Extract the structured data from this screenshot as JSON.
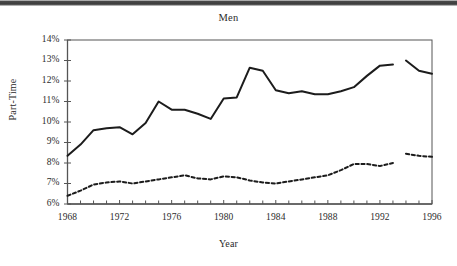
{
  "figure": {
    "title": "Men",
    "xlabel": "Year",
    "ylabel": "Part-Time"
  },
  "colors": {
    "line": "#1c1c1c",
    "axis": "#555555",
    "text": "#2b2b2b",
    "background": "#ffffff"
  },
  "axes": {
    "y_ticks": [
      "6%",
      "7%",
      "8%",
      "9%",
      "10%",
      "11%",
      "12%",
      "13%",
      "14%"
    ],
    "x_ticks": [
      "1968",
      "1972",
      "1976",
      "1980",
      "1984",
      "1988",
      "1992",
      "1996"
    ]
  },
  "chart_data": {
    "type": "line",
    "title": "Men",
    "xlabel": "Year",
    "ylabel": "Part-Time",
    "xlim": [
      1968,
      1996
    ],
    "ylim": [
      6,
      14
    ],
    "ytick_values": [
      6,
      7,
      8,
      9,
      10,
      11,
      12,
      13,
      14
    ],
    "ytick_labels": [
      "6%",
      "7%",
      "8%",
      "9%",
      "10%",
      "11%",
      "12%",
      "13%",
      "14%"
    ],
    "xtick_values": [
      1968,
      1972,
      1976,
      1980,
      1984,
      1988,
      1992,
      1996
    ],
    "xtick_labels": [
      "1968",
      "1972",
      "1976",
      "1980",
      "1984",
      "1988",
      "1992",
      "1996"
    ],
    "minor_xticks_every": 1,
    "grid": false,
    "legend": "none",
    "units": "percent",
    "note": "Both series have a data break between 1993 and 1994.",
    "series": [
      {
        "name": "Total part-time",
        "style": "solid",
        "segments": [
          {
            "x": [
              1968,
              1969,
              1970,
              1971,
              1972,
              1973,
              1974,
              1975,
              1976,
              1977,
              1978,
              1979,
              1980,
              1981,
              1982,
              1983,
              1984,
              1985,
              1986,
              1987,
              1988,
              1989,
              1990,
              1991,
              1992,
              1993
            ],
            "y": [
              8.35,
              8.9,
              9.6,
              9.7,
              9.75,
              9.4,
              9.95,
              11.0,
              10.6,
              10.6,
              10.4,
              10.15,
              11.15,
              11.2,
              12.65,
              12.5,
              11.55,
              11.4,
              11.5,
              11.35,
              11.35,
              11.5,
              11.7,
              12.25,
              12.75,
              12.8
            ]
          },
          {
            "x": [
              1994,
              1995,
              1996
            ],
            "y": [
              13.0,
              12.5,
              12.35
            ]
          }
        ]
      },
      {
        "name": "Part-time for economic reasons",
        "style": "dashed",
        "segments": [
          {
            "x": [
              1968,
              1969,
              1970,
              1971,
              1972,
              1973,
              1974,
              1975,
              1976,
              1977,
              1978,
              1979,
              1980,
              1981,
              1982,
              1983,
              1984,
              1985,
              1986,
              1987,
              1988,
              1989,
              1990,
              1991,
              1992,
              1993
            ],
            "y": [
              6.4,
              6.65,
              6.95,
              7.05,
              7.1,
              7.0,
              7.1,
              7.2,
              7.3,
              7.4,
              7.25,
              7.2,
              7.35,
              7.3,
              7.15,
              7.05,
              7.0,
              7.1,
              7.2,
              7.3,
              7.4,
              7.65,
              7.95,
              7.95,
              7.85,
              8.0
            ]
          },
          {
            "x": [
              1994,
              1995,
              1996
            ],
            "y": [
              8.45,
              8.35,
              8.3
            ]
          }
        ]
      }
    ]
  }
}
